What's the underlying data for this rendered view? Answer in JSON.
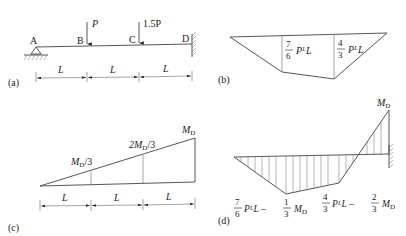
{
  "panels": {
    "a": {
      "tag": "(a)",
      "points": [
        "A",
        "B",
        "C",
        "D"
      ],
      "loads": [
        {
          "at": "B",
          "label": "P"
        },
        {
          "at": "C",
          "label": "1.5P"
        }
      ],
      "supports": {
        "A": "pin",
        "D": "fixed"
      },
      "spans": [
        "L",
        "L",
        "L"
      ]
    },
    "b": {
      "tag": "(b)",
      "ordinate_B": {
        "num": "7",
        "den": "6",
        "text": "PᴸL"
      },
      "ordinate_C": {
        "num": "4",
        "den": "3",
        "text": "PᴸL"
      }
    },
    "c": {
      "tag": "(c)",
      "labels": {
        "third": "M",
        "third_sub": "D",
        "third_suffix": "/3",
        "two_third_prefix": "2M",
        "two_third_sub": "D",
        "two_third_suffix": "/3",
        "end": "M",
        "end_sub": "D"
      },
      "spans": [
        "L",
        "L",
        "L"
      ]
    },
    "d": {
      "tag": "(d)",
      "end_label": "M",
      "end_sub": "D",
      "ordinate_B": {
        "num1": "7",
        "den1": "6",
        "mid": "PᴸL –",
        "num2": "1",
        "den2": "3",
        "tail": "M",
        "tail_sub": "D"
      },
      "ordinate_C": {
        "num1": "4",
        "den1": "3",
        "mid": "PᴸL –",
        "num2": "2",
        "den2": "3",
        "tail": "M",
        "tail_sub": "D"
      }
    }
  },
  "colors": {
    "line": "#444444",
    "thin": "#666666",
    "text": "#222222",
    "background": "#ffffff"
  }
}
